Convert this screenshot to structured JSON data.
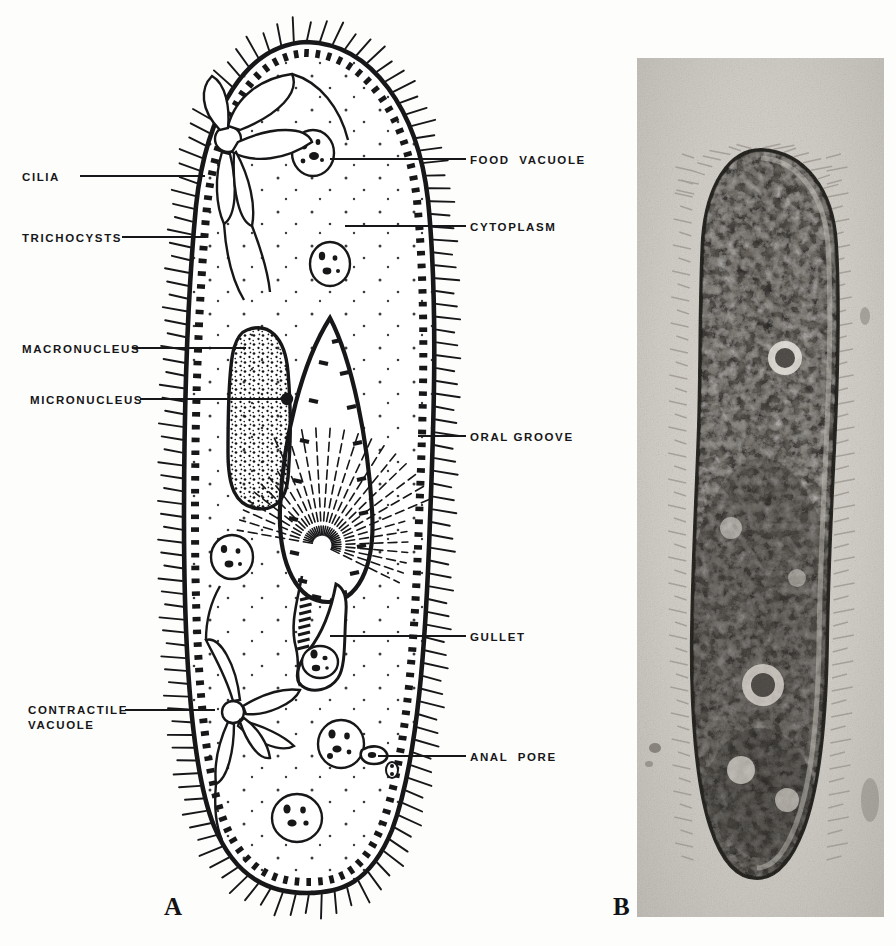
{
  "figure": {
    "panels": [
      {
        "id": "A",
        "letter": "A",
        "kind": "line-drawing",
        "subject": "Paramecium",
        "labels": [
          {
            "name": "cilia",
            "text": "CILIA",
            "side": "left",
            "x": 22,
            "y": 170,
            "leader_from_x": 80,
            "leader_to_x": 205,
            "leader_y": 176
          },
          {
            "name": "trichocysts",
            "text": "TRICHOCYSTS",
            "side": "left",
            "x": 22,
            "y": 231,
            "leader_from_x": 122,
            "leader_to_x": 206,
            "leader_y": 237
          },
          {
            "name": "macronucleus",
            "text": "MACRONUCLEUS",
            "side": "left",
            "x": 22,
            "y": 342,
            "leader_from_x": 132,
            "leader_to_x": 246,
            "leader_y": 348
          },
          {
            "name": "micronucleus",
            "text": "MICRONUCLEUS",
            "side": "left",
            "x": 30,
            "y": 393,
            "leader_from_x": 140,
            "leader_to_x": 285,
            "leader_y": 399
          },
          {
            "name": "contractile-vacuole",
            "text": "CONTRACTILE\nVACUOLE",
            "side": "left",
            "x": 28,
            "y": 703,
            "leader_from_x": 125,
            "leader_to_x": 215,
            "leader_y": 710
          },
          {
            "name": "food-vacuole",
            "text": "FOOD  VACUOLE",
            "side": "right",
            "x": 470,
            "y": 153,
            "leader_from_x": 330,
            "leader_to_x": 466,
            "leader_y": 159
          },
          {
            "name": "cytoplasm",
            "text": "CYTOPLASM",
            "side": "right",
            "x": 470,
            "y": 220,
            "leader_from_x": 345,
            "leader_to_x": 466,
            "leader_y": 226
          },
          {
            "name": "oral-groove",
            "text": "ORAL GROOVE",
            "side": "right",
            "x": 470,
            "y": 430,
            "leader_from_x": 418,
            "leader_to_x": 466,
            "leader_y": 436
          },
          {
            "name": "gullet",
            "text": "GULLET",
            "side": "right",
            "x": 470,
            "y": 630,
            "leader_from_x": 330,
            "leader_to_x": 466,
            "leader_y": 636
          },
          {
            "name": "anal-pore",
            "text": "ANAL  PORE",
            "side": "right",
            "x": 470,
            "y": 750,
            "leader_from_x": 378,
            "leader_to_x": 466,
            "leader_y": 756
          }
        ]
      },
      {
        "id": "B",
        "letter": "B",
        "kind": "photomicrograph",
        "subject": "Paramecium"
      }
    ],
    "panel_letters": [
      {
        "name": "panel-letter-a",
        "text": "A",
        "x": 164,
        "y": 893
      },
      {
        "name": "panel-letter-b",
        "text": "B",
        "x": 613,
        "y": 893
      }
    ],
    "colors": {
      "background": "#fdfdfb",
      "ink": "#17171a",
      "photo_base": "#bdbab4",
      "photo_dark": "#2a2724",
      "photo_light": "#e6e3dd"
    }
  }
}
